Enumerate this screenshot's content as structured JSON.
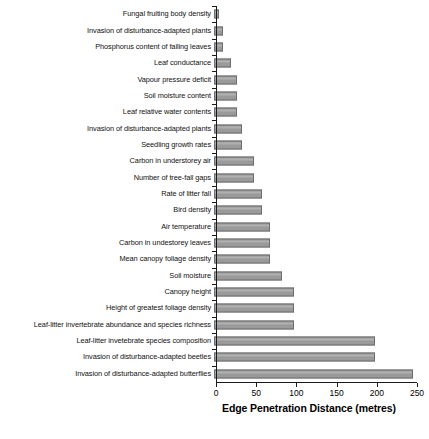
{
  "chart_data": {
    "type": "bar",
    "orientation": "horizontal",
    "title": "",
    "xlabel": "Edge Penetration Distance (metres)",
    "ylabel": "",
    "xlim": [
      0,
      250
    ],
    "xticks": [
      0,
      50,
      100,
      150,
      200,
      250
    ],
    "grid": false,
    "legend": "none",
    "bar_color": "#9a9a9a",
    "bar_edge_color": "#6d6d6d",
    "background_color": "#ffffff",
    "categories": [
      "Fungal fruiting body density",
      "Invasion of disturbance-adapted plants",
      "Phosphorus content of falling leaves",
      "Leaf conductance",
      "Vapour pressure deficit",
      "Soil moisture content",
      "Leaf relative water contents",
      "Invasion of disturbance-adapted plants",
      "Seedling growth rates",
      "Carbon in understorey air",
      "Number of tree-fall gaps",
      "Rate of litter fall",
      "Bird density",
      "Air temperature",
      "Carbon in undestorey leaves",
      "Mean canopy foliage density",
      "Soil moisture",
      "Canopy height",
      "Height of greatest foliage density",
      "Leaf-litter invertebrate abundance and species richness",
      "Leaf-litter invetebrate species composition",
      "Invasion of disturbance-adapted beetles",
      "Invasion of disturbance-adapted butterflies"
    ],
    "values": [
      6,
      11,
      11,
      21,
      28,
      28,
      28,
      35,
      35,
      50,
      50,
      60,
      60,
      70,
      70,
      70,
      85,
      100,
      100,
      100,
      200,
      200,
      248
    ]
  }
}
